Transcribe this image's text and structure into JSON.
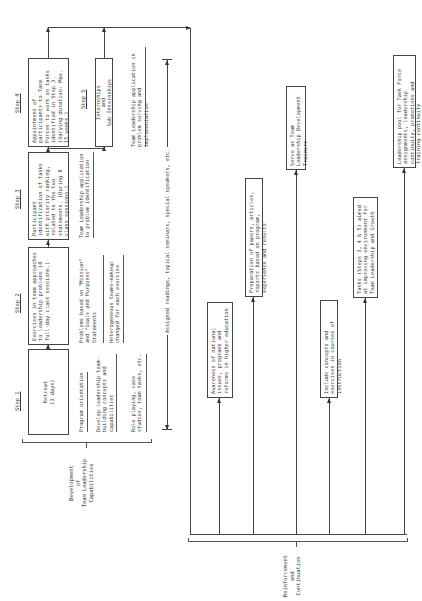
{
  "steps": [
    {
      "label": "Step 1",
      "box": "Retreat\n(3 days)"
    },
    {
      "label": "Step 2",
      "box": "Exercises in team approaches to leadership problems (8 full-day class sessions.)"
    },
    {
      "label": "Step 3",
      "box": "Participant identification of tasks with priority ranking, related to the two statements. (During 8 class sessions.)"
    },
    {
      "label": "Step 4",
      "box": "Appointment of participants to Task Forces to work on tasks identified in Step 3. (Varying duration: Max. 15 weeks.)"
    },
    {
      "label": "Step 5",
      "box": "Internships\nand\nSub-Internships"
    }
  ],
  "step_notes": {
    "step1": [
      "Program orientation",
      "Develop leadership team-building concepts and capabilities",
      "Role playing, case studies, team tasks, etc."
    ],
    "step2": [
      "Problems based on \"Mission\" and \"Goals and Purposes\" Statements",
      "Heterogeneous teams—makeup changed for each exercise"
    ],
    "step3": [
      "Team Leadership application to problem identification"
    ],
    "step4": [
      "Team Leadership application in problem solving and implementation"
    ]
  },
  "span_label": "Assigned readings, topical seminars, special speakers, etc.",
  "groups": {
    "development": "Development\nof\nTeam Leadership\nCapabilities",
    "reinforcement": "Reinforcement\nand\nContinuation"
  },
  "outcomes": [
    "Awareness of national issues, programs and reforms in higher education",
    "Preparation of papers, articles, reports based on program, experience and results",
    "Serve as Team Leadership Development Trainers",
    "Include concepts and exercises in courses of instruction",
    "Tasks (Steps 3, 4 & 5) aimed at improving environment for Team Leadership and Growth",
    "Leadership pool for Task Force assignments, leadership continuity, promotions and training continuity"
  ],
  "colors": {
    "line": "#444444",
    "text": "#3a3a3a",
    "background": "#ffffff"
  }
}
